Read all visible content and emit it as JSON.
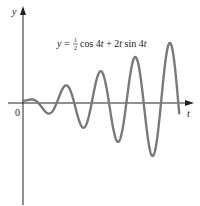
{
  "chart_data": {
    "type": "line",
    "title": "",
    "xlabel": "t",
    "ylabel": "y",
    "origin_label": "0",
    "annotation": {
      "prefix": "y = ",
      "frac_num": "1",
      "frac_den": "2",
      "suffix": "cos 4t + 2t sin 4t"
    },
    "function": "0.5*cos(4t) + 2t*sin(4t)",
    "series": [
      {
        "name": "y = ½cos 4t + 2t sin 4t",
        "t_range": [
          0,
          7.1
        ],
        "color": "#7a7a7a"
      }
    ],
    "xlim": [
      0,
      7.9
    ],
    "ylim": [
      -22,
      22
    ],
    "grid": false,
    "legend": "none",
    "ticks": {
      "x": [],
      "y": []
    }
  }
}
